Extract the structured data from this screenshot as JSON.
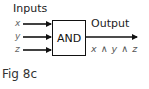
{
  "diagram": {
    "inputs_label": "Inputs",
    "inputs": [
      {
        "name": "x"
      },
      {
        "name": "y"
      },
      {
        "name": "z"
      }
    ],
    "gate": {
      "label": "AND"
    },
    "output_label": "Output",
    "output_expression": "x ∧ y ∧ z",
    "caption": "Fig 8c",
    "colors": {
      "line": "#111111",
      "variable_text": "#666666"
    }
  }
}
